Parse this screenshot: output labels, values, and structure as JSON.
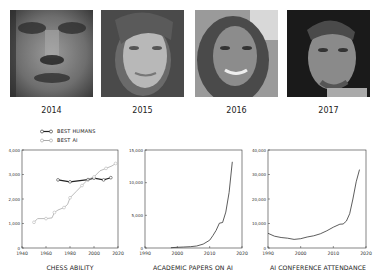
{
  "faces": [
    {
      "year": "2014",
      "description": "blurry grayscale generated face"
    },
    {
      "year": "2015",
      "description": "grayscale generated face, woman"
    },
    {
      "year": "2016",
      "description": "grayscale generated face, smiling woman"
    },
    {
      "year": "2017",
      "description": "grayscale generated face, man"
    }
  ],
  "legend": {
    "best_humans": "BEST HUMANS",
    "best_ai": "BEST AI"
  },
  "colors": {
    "humans": "#222222",
    "ai": "#aaaaaa",
    "axis": "#333333"
  },
  "chart_data": [
    {
      "type": "line",
      "title": "CHESS ABILITY",
      "xlabel": "",
      "ylabel": "",
      "xlim": [
        1940,
        2020
      ],
      "ylim": [
        0,
        4000
      ],
      "xticks": [
        "1940",
        "1960",
        "1980",
        "2000",
        "2020"
      ],
      "yticks": [
        "0",
        "1,000",
        "2,000",
        "3,000",
        "4,000"
      ],
      "legend_position": "top-left",
      "grid": false,
      "series": [
        {
          "name": "BEST HUMANS",
          "x": [
            1970,
            1980,
            1995,
            2000,
            2008,
            2014
          ],
          "y": [
            2780,
            2700,
            2790,
            2850,
            2780,
            2870
          ],
          "marker": "circle"
        },
        {
          "name": "BEST AI",
          "x": [
            1950,
            1953,
            1960,
            1965,
            1967,
            1970,
            1975,
            1978,
            1980,
            1985,
            1990,
            1995,
            2000,
            2005,
            2010,
            2015,
            2018
          ],
          "y": [
            1050,
            1200,
            1200,
            1230,
            1450,
            1550,
            1650,
            1780,
            2050,
            2300,
            2550,
            2800,
            2900,
            3150,
            3250,
            3350,
            3450
          ],
          "marker": "circle"
        }
      ]
    },
    {
      "type": "line",
      "title": "ACADEMIC PAPERS ON AI",
      "xlabel": "",
      "ylabel": "",
      "xlim": [
        1990,
        2020
      ],
      "ylim": [
        0,
        15000
      ],
      "xticks": [
        "1990",
        "2000",
        "2010",
        "2020"
      ],
      "yticks": [
        "0",
        "5,000",
        "10,000",
        "15,000"
      ],
      "grid": false,
      "series": [
        {
          "name": "Papers",
          "x": [
            1998,
            2000,
            2002,
            2004,
            2006,
            2008,
            2010,
            2011,
            2012,
            2013,
            2014,
            2015,
            2016,
            2017
          ],
          "y": [
            50,
            100,
            150,
            200,
            300,
            600,
            1200,
            1900,
            2700,
            3800,
            3900,
            5500,
            8500,
            13200
          ]
        }
      ]
    },
    {
      "type": "line",
      "title": "AI CONFERENCE ATTENDANCE",
      "xlabel": "",
      "ylabel": "",
      "xlim": [
        1990,
        2020
      ],
      "ylim": [
        0,
        40000
      ],
      "xticks": [
        "1990",
        "2000",
        "2010",
        "2020"
      ],
      "yticks": [
        "0",
        "10,000",
        "20,000",
        "30,000",
        "40,000"
      ],
      "grid": false,
      "series": [
        {
          "name": "Attendance",
          "x": [
            1990,
            1992,
            1994,
            1996,
            1998,
            2000,
            2002,
            2004,
            2006,
            2008,
            2010,
            2012,
            2013,
            2014,
            2015,
            2016,
            2017,
            2018
          ],
          "y": [
            6000,
            4800,
            4300,
            4000,
            3500,
            3800,
            4500,
            5000,
            5800,
            7000,
            8500,
            9700,
            9800,
            11000,
            14000,
            20000,
            27000,
            32000
          ]
        }
      ]
    }
  ]
}
